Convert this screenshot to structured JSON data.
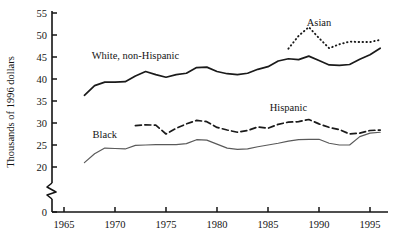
{
  "chart_data": {
    "type": "line",
    "title": "",
    "subtitle": "",
    "xlabel": "",
    "ylabel": "Thousands of 1996 dollars",
    "xlim": [
      1965,
      1996
    ],
    "ylim": [
      0,
      55
    ],
    "y_axis_break": "between 0 and 20",
    "y_ticks": [
      0,
      20,
      25,
      30,
      35,
      40,
      45,
      50,
      55
    ],
    "x_ticks": [
      1965,
      1970,
      1975,
      1980,
      1985,
      1990,
      1995
    ],
    "grid": false,
    "legend_position": "inline-annotations",
    "annotations": [
      {
        "text": "White, non-Hispanic",
        "x": 1972.0,
        "y": 44.6
      },
      {
        "text": "Asian",
        "x": 1990.0,
        "y": 52.0
      },
      {
        "text": "Hispanic",
        "x": 1987.0,
        "y": 32.8
      },
      {
        "text": "Black",
        "x": 1969.0,
        "y": 26.6
      }
    ],
    "series": [
      {
        "name": "White, non-Hispanic",
        "style": "solid",
        "color": "#1a1a1a",
        "x": [
          1967,
          1968,
          1969,
          1970,
          1971,
          1972,
          1973,
          1974,
          1975,
          1976,
          1977,
          1978,
          1979,
          1980,
          1981,
          1982,
          1983,
          1984,
          1985,
          1986,
          1987,
          1988,
          1989,
          1990,
          1991,
          1992,
          1993,
          1994,
          1995,
          1996
        ],
        "values": [
          36.3,
          38.5,
          39.3,
          39.3,
          39.4,
          40.7,
          41.7,
          41.0,
          40.4,
          41.0,
          41.3,
          42.6,
          42.7,
          41.7,
          41.2,
          41.0,
          41.3,
          42.2,
          42.8,
          44.1,
          44.6,
          44.4,
          45.2,
          44.2,
          43.2,
          43.1,
          43.3,
          44.5,
          45.5,
          47.0
        ]
      },
      {
        "name": "Asian",
        "style": "dotted",
        "color": "#1a1a1a",
        "x": [
          1987,
          1988,
          1989,
          1990,
          1991,
          1992,
          1993,
          1994,
          1995,
          1996
        ],
        "values": [
          46.9,
          49.8,
          51.8,
          49.3,
          47.0,
          47.9,
          48.5,
          48.4,
          48.4,
          48.9
        ]
      },
      {
        "name": "Hispanic",
        "style": "dashed",
        "color": "#1a1a1a",
        "x": [
          1972,
          1973,
          1974,
          1975,
          1976,
          1977,
          1978,
          1979,
          1980,
          1981,
          1982,
          1983,
          1984,
          1985,
          1986,
          1987,
          1988,
          1989,
          1990,
          1991,
          1992,
          1993,
          1994,
          1995,
          1996
        ],
        "values": [
          29.4,
          29.6,
          29.5,
          27.5,
          28.8,
          29.8,
          30.6,
          30.3,
          29.0,
          28.4,
          27.9,
          28.3,
          29.1,
          28.8,
          29.7,
          30.2,
          30.3,
          30.8,
          29.8,
          29.0,
          28.5,
          27.5,
          27.7,
          28.3,
          28.4
        ]
      },
      {
        "name": "Black",
        "style": "solid-thin",
        "color": "#5a5a5a",
        "x": [
          1967,
          1968,
          1969,
          1970,
          1971,
          1972,
          1973,
          1974,
          1975,
          1976,
          1977,
          1978,
          1979,
          1980,
          1981,
          1982,
          1983,
          1984,
          1985,
          1986,
          1987,
          1988,
          1989,
          1990,
          1991,
          1992,
          1993,
          1994,
          1995,
          1996
        ],
        "values": [
          21.0,
          23.0,
          24.3,
          24.2,
          24.1,
          24.9,
          25.0,
          25.1,
          25.1,
          25.1,
          25.3,
          26.2,
          26.1,
          25.2,
          24.3,
          24.0,
          24.1,
          24.6,
          25.0,
          25.4,
          25.9,
          26.2,
          26.3,
          26.3,
          25.4,
          25.0,
          25.0,
          26.9,
          27.7,
          27.9
        ]
      }
    ]
  }
}
